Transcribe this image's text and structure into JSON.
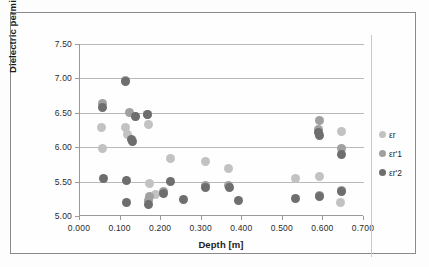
{
  "chart_data": {
    "type": "scatter",
    "title": "",
    "xlabel": "Depth [m]",
    "ylabel": "Dielectric permittivity",
    "xlim": [
      0.0,
      0.7
    ],
    "ylim": [
      5.0,
      7.5
    ],
    "xticks": [
      "0.000",
      "0.100",
      "0.200",
      "0.300",
      "0.400",
      "0.500",
      "0.600",
      "0.700"
    ],
    "xtick_values": [
      0.0,
      0.1,
      0.2,
      0.3,
      0.4,
      0.5,
      0.6,
      0.7
    ],
    "yticks": [
      "5.00",
      "5.50",
      "6.00",
      "6.50",
      "7.00",
      "7.50"
    ],
    "ytick_values": [
      5.0,
      5.5,
      6.0,
      6.5,
      7.0,
      7.5
    ],
    "grid": "horizontal",
    "legend_position": "right",
    "colors": {
      "series1": "#c2c2c2",
      "series2": "#a0a0a0",
      "series3": "#6e6e6e",
      "gridline": "#b9b9b9",
      "axis": "#9a9a9a",
      "frame": "#8a8a8a",
      "text": "#1c1c1c"
    },
    "series": [
      {
        "name": "εr",
        "color": "#c2c2c2",
        "points": [
          [
            0.052,
            6.29
          ],
          [
            0.055,
            5.98
          ],
          [
            0.112,
            6.29
          ],
          [
            0.118,
            6.18
          ],
          [
            0.138,
            6.44
          ],
          [
            0.17,
            6.33
          ],
          [
            0.172,
            5.47
          ],
          [
            0.186,
            5.31
          ],
          [
            0.222,
            5.84
          ],
          [
            0.31,
            5.79
          ],
          [
            0.365,
            5.69
          ],
          [
            0.53,
            5.55
          ],
          [
            0.59,
            5.57
          ],
          [
            0.645,
            6.23
          ],
          [
            0.642,
            5.19
          ]
        ]
      },
      {
        "name": "εr'1",
        "color": "#a0a0a0",
        "points": [
          [
            0.056,
            6.64
          ],
          [
            0.112,
            6.97
          ],
          [
            0.122,
            6.5
          ],
          [
            0.166,
            6.48
          ],
          [
            0.172,
            5.29
          ],
          [
            0.168,
            5.22
          ],
          [
            0.205,
            5.36
          ],
          [
            0.31,
            5.44
          ],
          [
            0.365,
            5.44
          ],
          [
            0.59,
            6.39
          ],
          [
            0.588,
            6.26
          ],
          [
            0.59,
            5.3
          ],
          [
            0.645,
            5.98
          ],
          [
            0.645,
            5.37
          ]
        ]
      },
      {
        "name": "εr'2",
        "color": "#6e6e6e",
        "points": [
          [
            0.055,
            6.58
          ],
          [
            0.057,
            5.54
          ],
          [
            0.112,
            6.95
          ],
          [
            0.126,
            6.11
          ],
          [
            0.13,
            6.08
          ],
          [
            0.114,
            5.51
          ],
          [
            0.114,
            5.2
          ],
          [
            0.138,
            6.44
          ],
          [
            0.166,
            6.48
          ],
          [
            0.17,
            5.16
          ],
          [
            0.205,
            5.33
          ],
          [
            0.222,
            5.5
          ],
          [
            0.255,
            5.24
          ],
          [
            0.31,
            5.41
          ],
          [
            0.368,
            5.41
          ],
          [
            0.39,
            5.23
          ],
          [
            0.53,
            5.26
          ],
          [
            0.59,
            6.17
          ],
          [
            0.588,
            6.22
          ],
          [
            0.59,
            5.29
          ],
          [
            0.645,
            5.89
          ],
          [
            0.645,
            5.35
          ]
        ]
      }
    ]
  },
  "legend": {
    "items": [
      {
        "label": "εr",
        "color": "#c2c2c2"
      },
      {
        "label": "εr'1",
        "color": "#a0a0a0"
      },
      {
        "label": "εr'2",
        "color": "#6e6e6e"
      }
    ]
  }
}
